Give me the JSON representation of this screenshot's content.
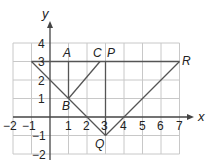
{
  "axes": {
    "x_label": "x",
    "y_label": "y",
    "x_ticks": [
      "−2",
      "−1",
      "1",
      "2",
      "3",
      "4",
      "5",
      "6",
      "7"
    ],
    "y_ticks": [
      "4",
      "3",
      "2",
      "1",
      "−1",
      "−2"
    ],
    "x_range": [
      -2,
      7
    ],
    "y_range": [
      -2,
      4
    ]
  },
  "points": {
    "A": {
      "label": "A",
      "x": 1,
      "y": 3
    },
    "B": {
      "label": "B",
      "x": 1,
      "y": 1
    },
    "C": {
      "label": "C",
      "x": 2.7,
      "y": 3
    },
    "P": {
      "label": "P",
      "x": 3,
      "y": 3
    },
    "Q": {
      "label": "Q",
      "x": 3,
      "y": -1
    },
    "R": {
      "label": "R",
      "x": 7,
      "y": 3
    }
  },
  "colors": {
    "grid": "#c8c8c8",
    "axis": "#444444",
    "line": "#555555"
  }
}
